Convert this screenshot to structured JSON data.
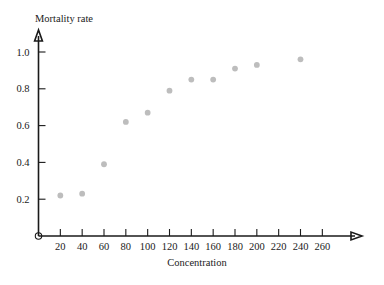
{
  "chart_data": {
    "type": "scatter",
    "title": "",
    "xlabel": "Concentration",
    "ylabel": "Mortality rate",
    "x": [
      20,
      40,
      60,
      80,
      100,
      120,
      140,
      160,
      180,
      200,
      240
    ],
    "values": [
      0.22,
      0.23,
      0.39,
      0.62,
      0.67,
      0.79,
      0.85,
      0.85,
      0.91,
      0.93,
      0.96
    ],
    "points": [
      {
        "x": 20,
        "y": 0.22
      },
      {
        "x": 40,
        "y": 0.23
      },
      {
        "x": 60,
        "y": 0.39
      },
      {
        "x": 80,
        "y": 0.62
      },
      {
        "x": 100,
        "y": 0.67
      },
      {
        "x": 120,
        "y": 0.79
      },
      {
        "x": 140,
        "y": 0.85
      },
      {
        "x": 160,
        "y": 0.85
      },
      {
        "x": 180,
        "y": 0.91
      },
      {
        "x": 200,
        "y": 0.93
      },
      {
        "x": 240,
        "y": 0.96
      }
    ],
    "xlim": [
      0,
      270
    ],
    "ylim": [
      0,
      1.1
    ],
    "xticks": [
      20,
      40,
      60,
      80,
      100,
      120,
      140,
      160,
      180,
      200,
      220,
      240,
      260
    ],
    "yticks": [
      0.2,
      0.4,
      0.6,
      0.8,
      1.0
    ],
    "xtick_labels": [
      "20",
      "40",
      "60",
      "80",
      "100",
      "120",
      "140",
      "160",
      "180",
      "200",
      "220",
      "240",
      "260"
    ],
    "ytick_labels": [
      "0.2",
      "0.4",
      "0.6",
      "0.8",
      "1.0"
    ],
    "grid": false,
    "legend": null,
    "marker_color": "#bdbdbd",
    "axis_color": "#1a1a1a",
    "origin_marker": "open-circle"
  }
}
